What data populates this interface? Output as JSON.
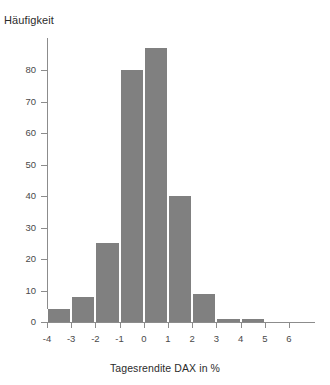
{
  "chart_data": {
    "type": "bar",
    "title": "",
    "subtitle": "",
    "xlabel": "Tagesrendite DAX in %",
    "ylabel": "Häufigkeit",
    "grid": false,
    "legend": false,
    "legend_position": "none",
    "bar_color": "#808080",
    "axis_color": "#8c8c8c",
    "bin_width": 1,
    "xlim": [
      -4,
      6
    ],
    "ylim": [
      0,
      90
    ],
    "x_ticks": [
      "-4",
      "-3",
      "-2",
      "-1",
      "0",
      "1",
      "2",
      "3",
      "4",
      "5",
      "6"
    ],
    "x_tick_values": [
      -4,
      -3,
      -2,
      -1,
      0,
      1,
      2,
      3,
      4,
      5,
      6
    ],
    "y_ticks": [
      "0",
      "10",
      "20",
      "30",
      "40",
      "50",
      "60",
      "70",
      "80"
    ],
    "y_tick_values": [
      0,
      10,
      20,
      30,
      40,
      50,
      60,
      70,
      80
    ],
    "categories": [
      "-4 to -3",
      "-3 to -2",
      "-2 to -1",
      "-1 to 0",
      "0 to 1",
      "1 to 2",
      "2 to 3",
      "3 to 4",
      "4 to 5",
      "5 to 6"
    ],
    "bin_edges": [
      -4,
      -3,
      -2,
      -1,
      0,
      1,
      2,
      3,
      4,
      5,
      6
    ],
    "values": [
      4,
      8,
      25,
      80,
      87,
      40,
      9,
      1,
      1,
      0
    ]
  }
}
